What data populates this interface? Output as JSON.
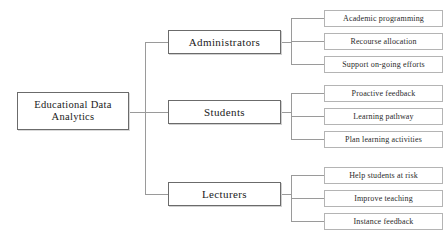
{
  "diagram": {
    "type": "tree",
    "orientation": "left-to-right",
    "root": {
      "label": "Educational  Data\nAnalytics"
    },
    "branches": [
      {
        "id": "administrators",
        "label": "Administrators",
        "leaves": [
          {
            "id": "academic-programming",
            "label": "Academic programming"
          },
          {
            "id": "recourse-allocation",
            "label": "Recourse allocation"
          },
          {
            "id": "support-on-going-efforts",
            "label": "Support on-going efforts"
          }
        ]
      },
      {
        "id": "students",
        "label": "Students",
        "leaves": [
          {
            "id": "proactive-feedback",
            "label": "Proactive feedback"
          },
          {
            "id": "learning-pathway",
            "label": "Learning pathway"
          },
          {
            "id": "plan-learning-activities",
            "label": "Plan learning activities"
          }
        ]
      },
      {
        "id": "lecturers",
        "label": "Lecturers",
        "leaves": [
          {
            "id": "help-students-at-risk",
            "label": "Help students at risk"
          },
          {
            "id": "improve-teaching",
            "label": "Improve teaching"
          },
          {
            "id": "instance-feedback",
            "label": "Instance feedback"
          }
        ]
      }
    ],
    "colors": {
      "line": "#9a9a9a",
      "root_border": "#6b6b6b",
      "branch_border": "#6b6b6b",
      "leaf_border": "#b4b4b4",
      "text": "#1a1a1a",
      "background": "#ffffff"
    }
  }
}
